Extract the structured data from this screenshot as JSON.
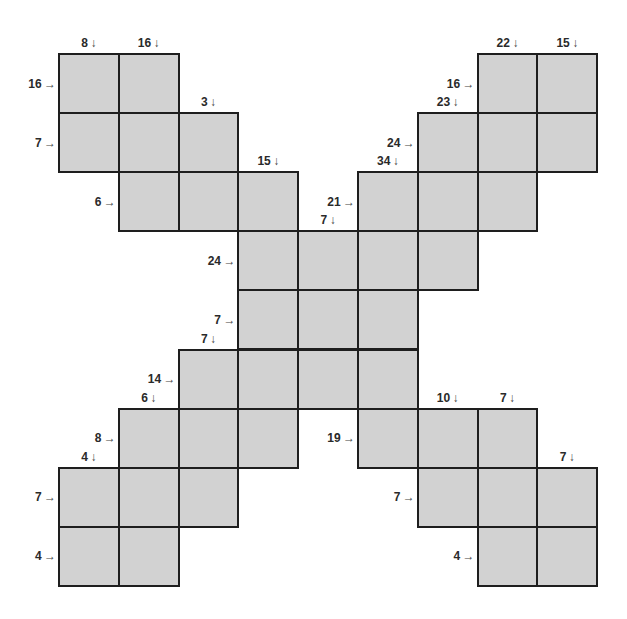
{
  "puzzle": {
    "type": "kakuro-x",
    "rows": 9,
    "cols": 9,
    "colors": {
      "cell_fill": "#d2d2d2",
      "cell_border": "#1e1e1e",
      "clue_text": "#2a2a2a"
    },
    "cells": [
      [
        0,
        0
      ],
      [
        0,
        1
      ],
      [
        0,
        7
      ],
      [
        0,
        8
      ],
      [
        1,
        0
      ],
      [
        1,
        1
      ],
      [
        1,
        2
      ],
      [
        1,
        6
      ],
      [
        1,
        7
      ],
      [
        1,
        8
      ],
      [
        2,
        1
      ],
      [
        2,
        2
      ],
      [
        2,
        3
      ],
      [
        2,
        5
      ],
      [
        2,
        6
      ],
      [
        2,
        7
      ],
      [
        3,
        3
      ],
      [
        3,
        4
      ],
      [
        3,
        5
      ],
      [
        3,
        6
      ],
      [
        4,
        3
      ],
      [
        4,
        4
      ],
      [
        4,
        5
      ],
      [
        5,
        2
      ],
      [
        5,
        3
      ],
      [
        5,
        4
      ],
      [
        5,
        5
      ],
      [
        6,
        1
      ],
      [
        6,
        2
      ],
      [
        6,
        3
      ],
      [
        6,
        5
      ],
      [
        6,
        6
      ],
      [
        6,
        7
      ],
      [
        7,
        0
      ],
      [
        7,
        1
      ],
      [
        7,
        2
      ],
      [
        7,
        6
      ],
      [
        7,
        7
      ],
      [
        7,
        8
      ],
      [
        8,
        0
      ],
      [
        8,
        1
      ],
      [
        8,
        7
      ],
      [
        8,
        8
      ]
    ],
    "down_clues": [
      {
        "label": "8",
        "arrow": "↓",
        "row": 0,
        "col": 0
      },
      {
        "label": "16",
        "arrow": "↓",
        "row": 0,
        "col": 1
      },
      {
        "label": "3",
        "arrow": "↓",
        "row": 1,
        "col": 2
      },
      {
        "label": "15",
        "arrow": "↓",
        "row": 2,
        "col": 3
      },
      {
        "label": "7",
        "arrow": "↓",
        "row": 3,
        "col": 4
      },
      {
        "label": "34",
        "arrow": "↓",
        "row": 2,
        "col": 5
      },
      {
        "label": "23",
        "arrow": "↓",
        "row": 1,
        "col": 6
      },
      {
        "label": "22",
        "arrow": "↓",
        "row": 0,
        "col": 7
      },
      {
        "label": "15",
        "arrow": "↓",
        "row": 0,
        "col": 8
      },
      {
        "label": "7",
        "arrow": "↓",
        "row": 5,
        "col": 2
      },
      {
        "label": "6",
        "arrow": "↓",
        "row": 6,
        "col": 1
      },
      {
        "label": "4",
        "arrow": "↓",
        "row": 7,
        "col": 0
      },
      {
        "label": "10",
        "arrow": "↓",
        "row": 6,
        "col": 6
      },
      {
        "label": "7",
        "arrow": "↓",
        "row": 6,
        "col": 7
      },
      {
        "label": "7",
        "arrow": "↓",
        "row": 7,
        "col": 8
      }
    ],
    "across_clues": [
      {
        "label": "16",
        "arrow": "→",
        "row": 0,
        "col": 0
      },
      {
        "label": "7",
        "arrow": "→",
        "row": 1,
        "col": 0
      },
      {
        "label": "6",
        "arrow": "→",
        "row": 2,
        "col": 1
      },
      {
        "label": "24",
        "arrow": "→",
        "row": 3,
        "col": 3
      },
      {
        "label": "7",
        "arrow": "→",
        "row": 4,
        "col": 3
      },
      {
        "label": "14",
        "arrow": "→",
        "row": 5,
        "col": 2
      },
      {
        "label": "8",
        "arrow": "→",
        "row": 6,
        "col": 1
      },
      {
        "label": "7",
        "arrow": "→",
        "row": 7,
        "col": 0
      },
      {
        "label": "4",
        "arrow": "→",
        "row": 8,
        "col": 0
      },
      {
        "label": "16",
        "arrow": "→",
        "row": 0,
        "col": 7
      },
      {
        "label": "24",
        "arrow": "→",
        "row": 1,
        "col": 6
      },
      {
        "label": "21",
        "arrow": "→",
        "row": 2,
        "col": 5
      },
      {
        "label": "19",
        "arrow": "→",
        "row": 6,
        "col": 5
      },
      {
        "label": "7",
        "arrow": "→",
        "row": 7,
        "col": 6
      },
      {
        "label": "4",
        "arrow": "→",
        "row": 8,
        "col": 7
      }
    ]
  }
}
